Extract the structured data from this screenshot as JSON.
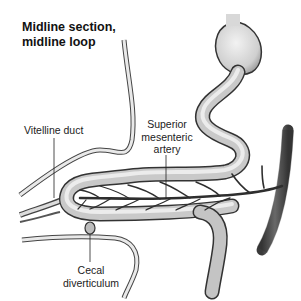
{
  "title": {
    "line1": "Midline section,",
    "line2": "midline loop"
  },
  "labels": {
    "vitelline_duct": "Vitelline duct",
    "sma_line1": "Superior",
    "sma_line2": "mesenteric",
    "sma_line3": "artery",
    "cecal_line1": "Cecal",
    "cecal_line2": "diverticulum"
  },
  "colors": {
    "gut_fill": "#cfcfcf",
    "gut_outline": "#3a3a3a",
    "vessel": "#2e2e2e",
    "aorta": "#555555",
    "text": "#222222"
  }
}
